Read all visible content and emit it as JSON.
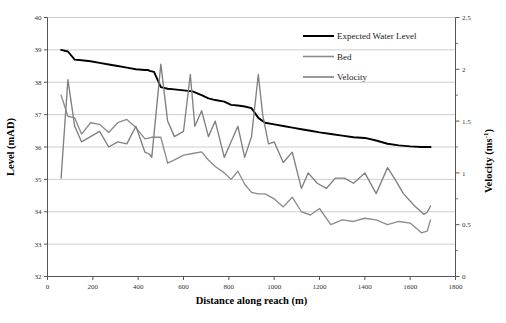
{
  "chart_data": {
    "type": "line",
    "title": "",
    "xlabel": "Distance along reach (m)",
    "ylabel": "Level (mAD)",
    "y2label": "Velocity (ms-1)",
    "y2label_base": "Velocity (ms",
    "y2label_sup": "-1",
    "y2label_tail": ")",
    "xlim": [
      0,
      1800
    ],
    "ylim": [
      32,
      40
    ],
    "y2lim": [
      0,
      2.5
    ],
    "xticks": [
      0,
      200,
      400,
      600,
      800,
      1000,
      1200,
      1400,
      1600,
      1800
    ],
    "xtick_labels": [
      "0",
      "200",
      "400",
      "600",
      "800",
      "1000",
      "1200",
      "1400",
      "1600",
      "1800"
    ],
    "yticks": [
      32,
      33,
      34,
      35,
      36,
      37,
      38,
      39,
      40
    ],
    "ytick_labels": [
      "32",
      "33",
      "34",
      "35",
      "36",
      "37",
      "38",
      "39",
      "40"
    ],
    "y2ticks": [
      0,
      0.5,
      1,
      1.5,
      2,
      2.5
    ],
    "y2tick_labels": [
      "0",
      "0.5",
      "1",
      "1.5",
      "2",
      "2.5"
    ],
    "y2minorticks": [
      0.25,
      0.75,
      1.25,
      1.75,
      2.25
    ],
    "grid": true,
    "grid_axis": "y",
    "legend_position": "top-right",
    "legend": [
      {
        "name": "Expected Water Level",
        "color": "#000000",
        "axis": "left",
        "width": 2.0
      },
      {
        "name": "Bed",
        "color": "#8c8c8c",
        "axis": "left",
        "width": 1.5
      },
      {
        "name": "Velocity",
        "color": "#808080",
        "axis": "right",
        "width": 1.5
      }
    ],
    "series": [
      {
        "name": "Expected Water Level",
        "axis": "left",
        "color": "#000000",
        "x": [
          60,
          90,
          120,
          150,
          190,
          230,
          270,
          310,
          350,
          390,
          430,
          445,
          450,
          470,
          500,
          530,
          560,
          600,
          640,
          680,
          710,
          740,
          780,
          810,
          840,
          870,
          900,
          930,
          960,
          1000,
          1040,
          1080,
          1120,
          1160,
          1200,
          1250,
          1300,
          1350,
          1400,
          1450,
          1500,
          1550,
          1600,
          1650,
          1690
        ],
        "y": [
          39.0,
          38.95,
          38.7,
          38.68,
          38.65,
          38.6,
          38.55,
          38.5,
          38.45,
          38.4,
          38.38,
          38.38,
          38.35,
          38.32,
          37.85,
          37.8,
          37.78,
          37.75,
          37.72,
          37.6,
          37.5,
          37.45,
          37.4,
          37.3,
          37.28,
          37.25,
          37.2,
          36.9,
          36.75,
          36.7,
          36.65,
          36.6,
          36.55,
          36.5,
          36.45,
          36.4,
          36.35,
          36.3,
          36.28,
          36.2,
          36.1,
          36.05,
          36.02,
          36.0,
          36.0
        ]
      },
      {
        "name": "Bed",
        "axis": "left",
        "color": "#8c8c8c",
        "x": [
          60,
          90,
          120,
          150,
          190,
          230,
          270,
          310,
          350,
          390,
          430,
          460,
          500,
          530,
          560,
          600,
          640,
          680,
          710,
          740,
          780,
          810,
          840,
          870,
          900,
          930,
          960,
          1000,
          1040,
          1080,
          1120,
          1160,
          1200,
          1250,
          1300,
          1350,
          1400,
          1450,
          1500,
          1550,
          1600,
          1650,
          1675,
          1690
        ],
        "y": [
          37.6,
          36.95,
          36.9,
          36.4,
          36.75,
          36.7,
          36.45,
          36.75,
          36.85,
          36.6,
          36.25,
          36.3,
          36.3,
          35.5,
          35.6,
          35.75,
          35.8,
          35.85,
          35.6,
          35.4,
          35.2,
          35.0,
          35.25,
          34.85,
          34.6,
          34.55,
          34.55,
          34.4,
          34.15,
          34.45,
          34.0,
          33.9,
          34.1,
          33.6,
          33.75,
          33.7,
          33.8,
          33.75,
          33.6,
          33.7,
          33.65,
          33.35,
          33.4,
          33.75
        ]
      },
      {
        "name": "Velocity",
        "axis": "right",
        "color": "#808080",
        "x": [
          60,
          90,
          120,
          150,
          190,
          230,
          270,
          310,
          350,
          390,
          430,
          450,
          460,
          500,
          530,
          560,
          600,
          630,
          650,
          680,
          710,
          740,
          780,
          810,
          840,
          870,
          900,
          930,
          950,
          975,
          1000,
          1040,
          1080,
          1120,
          1150,
          1190,
          1230,
          1270,
          1310,
          1350,
          1400,
          1450,
          1500,
          1530,
          1570,
          1620,
          1660,
          1675,
          1690
        ],
        "y": [
          0.95,
          1.9,
          1.45,
          1.3,
          1.35,
          1.4,
          1.25,
          1.3,
          1.28,
          1.45,
          1.2,
          1.18,
          1.15,
          2.05,
          1.5,
          1.35,
          1.4,
          1.95,
          1.45,
          1.6,
          1.35,
          1.5,
          1.15,
          1.3,
          1.45,
          1.15,
          1.35,
          1.95,
          1.55,
          1.28,
          1.3,
          1.1,
          1.2,
          0.85,
          1.0,
          0.9,
          0.85,
          0.95,
          0.95,
          0.9,
          1.0,
          0.8,
          1.05,
          0.95,
          0.8,
          0.68,
          0.6,
          0.62,
          0.68
        ]
      }
    ]
  },
  "colors": {
    "water_level": "#000000",
    "bed": "#8c8c8c",
    "velocity": "#808080",
    "gridline": "#c8c8c8",
    "axis": "#555555",
    "background": "#ffffff"
  }
}
